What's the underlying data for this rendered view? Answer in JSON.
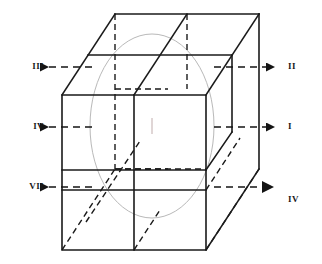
{
  "figure": {
    "type": "3d-cube-octant-diagram",
    "background_color": "#ffffff",
    "line_color": "#1a1a1a",
    "ellipse_color": "#b9b9b9"
  },
  "labels": {
    "left": [
      {
        "id": "left-top",
        "text": "III",
        "x": 22,
        "y": 62,
        "arrow_y": 67
      },
      {
        "id": "left-middle",
        "text": "IV",
        "x": 22,
        "y": 122,
        "arrow_y": 127
      },
      {
        "id": "left-bottom",
        "text": "VII",
        "x": 22,
        "y": 182,
        "arrow_y": 187
      }
    ],
    "right": [
      {
        "id": "right-top",
        "text": "II",
        "x": 290,
        "y": 62,
        "arrow_y": 67
      },
      {
        "id": "right-middle",
        "text": "I",
        "x": 290,
        "y": 122,
        "arrow_y": 127
      },
      {
        "id": "right-bottom",
        "text": "IV",
        "x": 290,
        "y": 195,
        "arrow_y": 187
      }
    ]
  },
  "geometry": {
    "front_face": {
      "left": 62,
      "right": 206,
      "top": 95,
      "bottom": 250
    },
    "depth_offset": {
      "dx": 53,
      "dy": -81
    },
    "front_vertical_divider_x": 134,
    "front_horizontal_dividers_y": [
      170,
      190
    ],
    "ellipse": {
      "cx": 152,
      "cy": 126,
      "rx": 62,
      "ry": 92
    }
  },
  "arrows": {
    "left_tip_x": 38,
    "left_tail_x": 92,
    "right_tip_x": 268,
    "right_tail_x": 214,
    "dash_pattern": "7 5"
  }
}
